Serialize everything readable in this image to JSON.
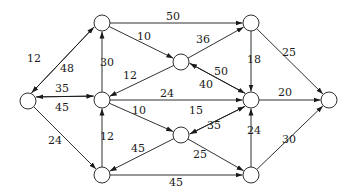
{
  "diagram": {
    "type": "directed-weighted-graph",
    "nodes": [
      {
        "id": "A",
        "x": 28,
        "y": 101
      },
      {
        "id": "B",
        "x": 102,
        "y": 23
      },
      {
        "id": "C",
        "x": 181,
        "y": 62
      },
      {
        "id": "D",
        "x": 251,
        "y": 23
      },
      {
        "id": "E",
        "x": 102,
        "y": 100
      },
      {
        "id": "F",
        "x": 251,
        "y": 100
      },
      {
        "id": "G",
        "x": 329,
        "y": 100
      },
      {
        "id": "H",
        "x": 181,
        "y": 135
      },
      {
        "id": "I",
        "x": 102,
        "y": 175
      },
      {
        "id": "J",
        "x": 251,
        "y": 175
      }
    ],
    "edges": [
      {
        "from": "A",
        "to": "B",
        "weight": "12",
        "offset": -3,
        "lx": 34,
        "ly": 62
      },
      {
        "from": "B",
        "to": "A",
        "weight": "48",
        "offset": -3,
        "lx": 67,
        "ly": 72
      },
      {
        "from": "A",
        "to": "E",
        "weight": "35",
        "offset": -4,
        "lx": 62,
        "ly": 92
      },
      {
        "from": "E",
        "to": "A",
        "weight": "45",
        "offset": -4,
        "lx": 62,
        "ly": 111
      },
      {
        "from": "A",
        "to": "I",
        "weight": "24",
        "offset": 0,
        "lx": 55,
        "ly": 144
      },
      {
        "from": "B",
        "to": "D",
        "weight": "50",
        "offset": 0,
        "lx": 173,
        "ly": 20
      },
      {
        "from": "B",
        "to": "C",
        "weight": "10",
        "offset": 0,
        "lx": 144,
        "ly": 40
      },
      {
        "from": "E",
        "to": "B",
        "weight": "30",
        "offset": 0,
        "lx": 107,
        "ly": 66
      },
      {
        "from": "C",
        "to": "E",
        "weight": "12",
        "offset": 0,
        "lx": 130,
        "ly": 79
      },
      {
        "from": "C",
        "to": "D",
        "weight": "36",
        "offset": 0,
        "lx": 203,
        "ly": 43
      },
      {
        "from": "C",
        "to": "F",
        "weight": "50",
        "offset": -3,
        "lx": 221,
        "ly": 75
      },
      {
        "from": "F",
        "to": "C",
        "weight": "40",
        "offset": -3,
        "lx": 206,
        "ly": 88
      },
      {
        "from": "E",
        "to": "F",
        "weight": "24",
        "offset": 0,
        "lx": 167,
        "ly": 97
      },
      {
        "from": "E",
        "to": "H",
        "weight": "10",
        "offset": 0,
        "lx": 139,
        "ly": 114
      },
      {
        "from": "I",
        "to": "E",
        "weight": "12",
        "offset": 0,
        "lx": 107,
        "ly": 140
      },
      {
        "from": "H",
        "to": "I",
        "weight": "45",
        "offset": 0,
        "lx": 138,
        "ly": 152
      },
      {
        "from": "H",
        "to": "J",
        "weight": "25",
        "offset": 0,
        "lx": 200,
        "ly": 158
      },
      {
        "from": "H",
        "to": "F",
        "weight": "35",
        "offset": -3,
        "lx": 214,
        "ly": 129
      },
      {
        "from": "F",
        "to": "H",
        "weight": "15",
        "offset": -3,
        "lx": 196,
        "ly": 114
      },
      {
        "from": "D",
        "to": "F",
        "weight": "18",
        "offset": 0,
        "lx": 254,
        "ly": 63
      },
      {
        "from": "D",
        "to": "G",
        "weight": "25",
        "offset": 0,
        "lx": 289,
        "ly": 56
      },
      {
        "from": "F",
        "to": "G",
        "weight": "20",
        "offset": 0,
        "lx": 285,
        "ly": 96
      },
      {
        "from": "J",
        "to": "F",
        "weight": "24",
        "offset": 0,
        "lx": 254,
        "ly": 134
      },
      {
        "from": "J",
        "to": "G",
        "weight": "30",
        "offset": 0,
        "lx": 289,
        "ly": 143
      },
      {
        "from": "I",
        "to": "J",
        "weight": "45",
        "offset": 0,
        "lx": 176,
        "ly": 186
      }
    ],
    "style": {
      "node_radius": 8,
      "stroke": "#1a1a1a",
      "fill": "#ffffff"
    }
  }
}
